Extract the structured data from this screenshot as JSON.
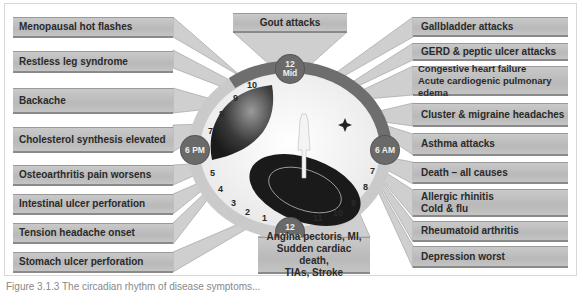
{
  "diagram": {
    "top_box": "Gout attacks",
    "bottom_box": [
      "Angina pectoris, MI,",
      "Sudden cardiac death,",
      "TIAs, Stroke"
    ],
    "left_boxes": [
      {
        "label": "Menopausal hot flashes",
        "time": "10"
      },
      {
        "label": "Restless leg syndrome",
        "time": "9"
      },
      {
        "label": "Backache",
        "time": "8"
      },
      {
        "label": "Cholesterol synthesis elevated",
        "time": "7"
      },
      {
        "label": "Osteoarthritis pain worsens",
        "time": "5"
      },
      {
        "label": "Intestinal ulcer perforation",
        "time": "4"
      },
      {
        "label": "Tension headache onset",
        "time": "4"
      },
      {
        "label": "Stomach ulcer perforation",
        "time": "1"
      }
    ],
    "right_boxes": [
      {
        "label": "Gallbladder attacks",
        "time": "1"
      },
      {
        "label": "GERD & peptic ulcer attacks",
        "time": "2"
      },
      {
        "label_lines": [
          "Congestive heart failure",
          "Acute cardiogenic pulmonary edema"
        ],
        "time": "2"
      },
      {
        "label": "Cluster & migraine headaches",
        "time": "4"
      },
      {
        "label": "Asthma attacks",
        "time": "5"
      },
      {
        "label": "Death – all causes",
        "time": "6 AM"
      },
      {
        "label_lines": [
          "Allergic rhinitis",
          "Cold & flu"
        ],
        "time": "7"
      },
      {
        "label": "Rheumatoid arthritis",
        "time": "7"
      },
      {
        "label": "Depression worst",
        "time": "7"
      }
    ],
    "clock": {
      "badges": {
        "mid": [
          "12",
          "Mid"
        ],
        "noon": [
          "12",
          "Noon"
        ],
        "six_am": "6 AM",
        "six_pm": "6 PM"
      },
      "hours_night_right": [
        "1",
        "2",
        "3",
        "4",
        "5"
      ],
      "hours_morning": [
        "7",
        "8",
        "9",
        "10",
        "11"
      ],
      "hours_afternoon": [
        "1",
        "2",
        "3",
        "4",
        "5"
      ],
      "hours_evening": [
        "7",
        "8",
        "9",
        "10",
        "11"
      ]
    },
    "colors": {
      "box": "#c0c0c0",
      "ring_night": "#6e6e6e",
      "ring_day": "#c8c8c8",
      "badge": "#6a6a6a"
    }
  },
  "caption": "Figure 3.1.3 The circadian rhythm of disease symptoms..."
}
